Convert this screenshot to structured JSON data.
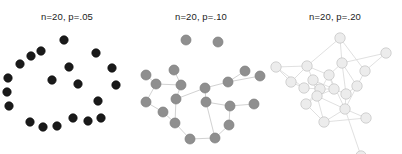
{
  "figure": {
    "width": 402,
    "height": 154,
    "background": "#ffffff"
  },
  "panels": [
    {
      "id": "panel-p05",
      "title": "n=20, p=.05",
      "n_label": "n=20",
      "p_label": "p=.05",
      "n": 20,
      "p": 0.05,
      "node_fill": "#1a1a1a",
      "node_stroke": "#0d0d0d",
      "edge_color": "#bdbdbd",
      "node_radius": 4.2,
      "edge_width": 0.8,
      "nodes": [
        [
          64,
          14
        ],
        [
          41,
          25
        ],
        [
          31,
          30
        ],
        [
          96,
          27
        ],
        [
          20,
          38
        ],
        [
          69,
          41
        ],
        [
          112,
          42
        ],
        [
          52,
          54
        ],
        [
          8,
          52
        ],
        [
          78,
          58
        ],
        [
          116,
          59
        ],
        [
          7,
          66
        ],
        [
          9,
          80
        ],
        [
          98,
          75
        ],
        [
          101,
          92
        ],
        [
          30,
          96
        ],
        [
          43,
          101
        ],
        [
          57,
          100
        ],
        [
          73,
          92
        ],
        [
          88,
          95
        ]
      ],
      "edges": []
    },
    {
      "id": "panel-p10",
      "title": "n=20, p=.10",
      "n_label": "n=20",
      "p_label": "p=.10",
      "n": 20,
      "p": 0.1,
      "node_fill": "#8f8f8f",
      "node_stroke": "#7d7d7d",
      "edge_color": "#d2d2d2",
      "node_radius": 5.0,
      "edge_width": 1.0,
      "nodes": [
        [
          52,
          14
        ],
        [
          84,
          16
        ],
        [
          40,
          44
        ],
        [
          12,
          49
        ],
        [
          111,
          45
        ],
        [
          47,
          59
        ],
        [
          94,
          56
        ],
        [
          126,
          50
        ],
        [
          22,
          58
        ],
        [
          71,
          62
        ],
        [
          12,
          76
        ],
        [
          72,
          76
        ],
        [
          42,
          73
        ],
        [
          96,
          80
        ],
        [
          120,
          78
        ],
        [
          29,
          86
        ],
        [
          41,
          97
        ],
        [
          95,
          99
        ],
        [
          56,
          113
        ],
        [
          81,
          112
        ]
      ],
      "edges": [
        [
          2,
          5
        ],
        [
          3,
          8
        ],
        [
          8,
          5
        ],
        [
          5,
          12
        ],
        [
          12,
          9
        ],
        [
          9,
          6
        ],
        [
          6,
          4
        ],
        [
          6,
          7
        ],
        [
          9,
          11
        ],
        [
          11,
          13
        ],
        [
          13,
          14
        ],
        [
          13,
          17
        ],
        [
          17,
          19
        ],
        [
          19,
          18
        ],
        [
          18,
          16
        ],
        [
          16,
          12
        ],
        [
          8,
          10
        ],
        [
          10,
          15
        ],
        [
          15,
          16
        ],
        [
          11,
          19
        ]
      ]
    },
    {
      "id": "panel-p20",
      "title": "n=20, p=.20",
      "n_label": "n=20",
      "p_label": "p=.20",
      "n": 20,
      "p": 0.2,
      "node_fill": "#ececec",
      "node_stroke": "#c2c2c2",
      "edge_color": "#dcdcdc",
      "node_radius": 5.2,
      "edge_width": 0.9,
      "nodes": [
        [
          72,
          12
        ],
        [
          118,
          27
        ],
        [
          39,
          40
        ],
        [
          74,
          37
        ],
        [
          8,
          41
        ],
        [
          45,
          54
        ],
        [
          61,
          49
        ],
        [
          97,
          45
        ],
        [
          89,
          60
        ],
        [
          23,
          56
        ],
        [
          36,
          62
        ],
        [
          52,
          63
        ],
        [
          66,
          63
        ],
        [
          49,
          70
        ],
        [
          78,
          68
        ],
        [
          38,
          78
        ],
        [
          77,
          83
        ],
        [
          56,
          96
        ],
        [
          98,
          92
        ],
        [
          93,
          130
        ]
      ],
      "edges": [
        [
          0,
          3
        ],
        [
          0,
          7
        ],
        [
          0,
          2
        ],
        [
          1,
          7
        ],
        [
          1,
          3
        ],
        [
          2,
          4
        ],
        [
          2,
          5
        ],
        [
          2,
          6
        ],
        [
          2,
          9
        ],
        [
          3,
          6
        ],
        [
          3,
          8
        ],
        [
          3,
          14
        ],
        [
          4,
          9
        ],
        [
          4,
          10
        ],
        [
          5,
          10
        ],
        [
          5,
          11
        ],
        [
          5,
          12
        ],
        [
          5,
          13
        ],
        [
          6,
          12
        ],
        [
          6,
          13
        ],
        [
          7,
          8
        ],
        [
          8,
          14
        ],
        [
          8,
          16
        ],
        [
          9,
          10
        ],
        [
          10,
          11
        ],
        [
          11,
          12
        ],
        [
          11,
          13
        ],
        [
          11,
          15
        ],
        [
          12,
          13
        ],
        [
          12,
          14
        ],
        [
          13,
          15
        ],
        [
          13,
          16
        ],
        [
          13,
          17
        ],
        [
          14,
          16
        ],
        [
          15,
          17
        ],
        [
          16,
          17
        ],
        [
          16,
          18
        ],
        [
          16,
          19
        ],
        [
          17,
          18
        ],
        [
          6,
          16
        ]
      ]
    }
  ]
}
